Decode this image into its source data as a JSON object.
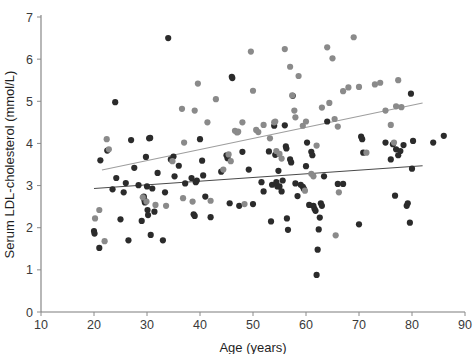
{
  "figure": {
    "background_color": "#ffffff",
    "axis_color": "#7d7d7d"
  },
  "chart_data": {
    "type": "scatter",
    "title": "",
    "subtitle": "",
    "xlabel": "Age (years)",
    "ylabel": "Serum LDL-cholesterol  (mmol/L)",
    "xlim": [
      10,
      90
    ],
    "ylim": [
      0,
      7
    ],
    "xticks": [
      10,
      20,
      30,
      40,
      50,
      60,
      70,
      80,
      90
    ],
    "yticks": [
      0,
      1,
      2,
      3,
      4,
      5,
      6,
      7
    ],
    "xtick_labels": [
      "10",
      "20",
      "30",
      "40",
      "50",
      "60",
      "70",
      "80",
      "90"
    ],
    "ytick_labels": [
      "0",
      "1",
      "2",
      "3",
      "4",
      "5",
      "6",
      "7"
    ],
    "grid": false,
    "legend": "none",
    "marker_radius": 3.1,
    "series": [
      {
        "name": "dark-group",
        "color": "#2b2b2b",
        "points": [
          [
            20.0,
            1.92
          ],
          [
            20.1,
            1.86
          ],
          [
            21.0,
            1.52
          ],
          [
            21.2,
            3.6
          ],
          [
            22.5,
            3.83
          ],
          [
            23.5,
            2.91
          ],
          [
            24.0,
            4.98
          ],
          [
            24.2,
            3.18
          ],
          [
            25.0,
            2.2
          ],
          [
            25.6,
            2.84
          ],
          [
            26.0,
            3.06
          ],
          [
            26.5,
            1.7
          ],
          [
            27.0,
            4.08
          ],
          [
            27.6,
            3.42
          ],
          [
            28.4,
            3.01
          ],
          [
            29.0,
            2.16
          ],
          [
            29.4,
            2.74
          ],
          [
            29.5,
            2.66
          ],
          [
            29.6,
            2.6
          ],
          [
            29.8,
            3.68
          ],
          [
            30.0,
            2.98
          ],
          [
            30.1,
            2.42
          ],
          [
            30.2,
            2.3
          ],
          [
            30.4,
            4.12
          ],
          [
            30.6,
            4.13
          ],
          [
            30.7,
            1.83
          ],
          [
            31.0,
            2.93
          ],
          [
            31.4,
            2.38
          ],
          [
            32.0,
            3.3
          ],
          [
            33.0,
            1.7
          ],
          [
            33.4,
            2.84
          ],
          [
            34.0,
            6.5
          ],
          [
            34.5,
            3.62
          ],
          [
            35.0,
            3.69
          ],
          [
            35.2,
            3.22
          ],
          [
            36.0,
            3.47
          ],
          [
            37.2,
            3.05
          ],
          [
            38.4,
            3.18
          ],
          [
            38.8,
            2.32
          ],
          [
            39.0,
            2.28
          ],
          [
            39.2,
            3.08
          ],
          [
            39.4,
            3.12
          ],
          [
            40.0,
            4.1
          ],
          [
            40.4,
            3.59
          ],
          [
            40.6,
            3.24
          ],
          [
            41.0,
            2.74
          ],
          [
            42.0,
            2.25
          ],
          [
            44.0,
            3.33
          ],
          [
            45.0,
            3.72
          ],
          [
            45.2,
            3.65
          ],
          [
            45.6,
            2.58
          ],
          [
            46.0,
            5.58
          ],
          [
            46.1,
            5.55
          ],
          [
            47.4,
            2.52
          ],
          [
            48.0,
            3.8
          ],
          [
            49.2,
            3.38
          ],
          [
            50.0,
            2.56
          ],
          [
            51.6,
            3.08
          ],
          [
            52.0,
            2.86
          ],
          [
            53.0,
            3.81
          ],
          [
            53.4,
            2.15
          ],
          [
            53.6,
            3.02
          ],
          [
            54.0,
            4.42
          ],
          [
            54.2,
            3.73
          ],
          [
            54.4,
            3.08
          ],
          [
            54.6,
            2.98
          ],
          [
            54.8,
            3.35
          ],
          [
            55.0,
            2.98
          ],
          [
            55.4,
            2.86
          ],
          [
            55.6,
            3.12
          ],
          [
            56.0,
            4.43
          ],
          [
            56.2,
            3.93
          ],
          [
            56.3,
            3.88
          ],
          [
            56.4,
            2.22
          ],
          [
            56.6,
            1.95
          ],
          [
            57.0,
            3.62
          ],
          [
            57.2,
            3.55
          ],
          [
            57.5,
            5.13
          ],
          [
            58.0,
            3.05
          ],
          [
            58.4,
            2.75
          ],
          [
            59.0,
            3.02
          ],
          [
            59.4,
            2.97
          ],
          [
            59.6,
            2.92
          ],
          [
            60.0,
            3.46
          ],
          [
            60.2,
            4.02
          ],
          [
            60.6,
            2.54
          ],
          [
            61.0,
            3.8
          ],
          [
            61.2,
            3.72
          ],
          [
            61.4,
            2.52
          ],
          [
            61.6,
            2.45
          ],
          [
            61.8,
            2.4
          ],
          [
            62.0,
            0.88
          ],
          [
            62.2,
            1.48
          ],
          [
            62.4,
            1.96
          ],
          [
            62.6,
            2.24
          ],
          [
            62.8,
            2.58
          ],
          [
            63.0,
            2.52
          ],
          [
            63.4,
            3.22
          ],
          [
            64.0,
            4.52
          ],
          [
            66.0,
            3.04
          ],
          [
            67.0,
            3.04
          ],
          [
            70.0,
            2.08
          ],
          [
            70.4,
            4.16
          ],
          [
            70.6,
            4.1
          ],
          [
            70.8,
            3.78
          ],
          [
            75.0,
            4.02
          ],
          [
            76.0,
            3.62
          ],
          [
            76.4,
            3.98
          ],
          [
            76.8,
            2.76
          ],
          [
            77.0,
            3.86
          ],
          [
            77.4,
            3.72
          ],
          [
            77.8,
            3.82
          ],
          [
            78.4,
            3.96
          ],
          [
            79.0,
            2.52
          ],
          [
            79.2,
            2.58
          ],
          [
            79.6,
            2.12
          ],
          [
            79.8,
            5.18
          ],
          [
            80.0,
            3.4
          ],
          [
            80.2,
            4.06
          ],
          [
            84.0,
            4.02
          ],
          [
            86.0,
            4.18
          ]
        ]
      },
      {
        "name": "light-group",
        "color": "#8a8a8a",
        "points": [
          [
            20.2,
            2.22
          ],
          [
            21.0,
            2.42
          ],
          [
            22.0,
            1.68
          ],
          [
            22.4,
            4.1
          ],
          [
            22.8,
            3.86
          ],
          [
            29.2,
            2.72
          ],
          [
            29.9,
            2.62
          ],
          [
            31.6,
            2.54
          ],
          [
            33.6,
            2.52
          ],
          [
            34.8,
            3.58
          ],
          [
            36.6,
            4.82
          ],
          [
            36.8,
            2.7
          ],
          [
            37.0,
            4.02
          ],
          [
            38.6,
            2.62
          ],
          [
            39.0,
            4.78
          ],
          [
            39.6,
            5.42
          ],
          [
            41.4,
            4.5
          ],
          [
            42.0,
            2.64
          ],
          [
            43.0,
            5.05
          ],
          [
            44.4,
            3.38
          ],
          [
            45.4,
            3.74
          ],
          [
            45.8,
            3.58
          ],
          [
            46.6,
            4.3
          ],
          [
            47.0,
            4.26
          ],
          [
            47.2,
            4.28
          ],
          [
            48.0,
            4.5
          ],
          [
            48.4,
            2.56
          ],
          [
            49.6,
            6.18
          ],
          [
            50.0,
            5.25
          ],
          [
            50.6,
            4.32
          ],
          [
            51.0,
            4.27
          ],
          [
            52.0,
            4.44
          ],
          [
            53.2,
            4.12
          ],
          [
            54.0,
            4.5
          ],
          [
            54.2,
            4.52
          ],
          [
            54.4,
            3.82
          ],
          [
            55.0,
            3.75
          ],
          [
            55.4,
            3.64
          ],
          [
            56.0,
            6.24
          ],
          [
            57.0,
            5.82
          ],
          [
            57.4,
            5.14
          ],
          [
            57.8,
            4.78
          ],
          [
            58.0,
            4.62
          ],
          [
            58.6,
            5.6
          ],
          [
            59.4,
            4.42
          ],
          [
            59.8,
            2.88
          ],
          [
            60.0,
            4.52
          ],
          [
            61.0,
            3.28
          ],
          [
            61.4,
            3.22
          ],
          [
            62.0,
            3.95
          ],
          [
            63.0,
            4.85
          ],
          [
            64.0,
            6.28
          ],
          [
            64.4,
            4.96
          ],
          [
            65.0,
            6.02
          ],
          [
            65.4,
            4.58
          ],
          [
            65.6,
            1.82
          ],
          [
            66.0,
            4.4
          ],
          [
            66.2,
            2.84
          ],
          [
            67.0,
            5.24
          ],
          [
            68.0,
            5.33
          ],
          [
            69.0,
            6.52
          ],
          [
            70.0,
            5.34
          ],
          [
            71.4,
            3.78
          ],
          [
            73.0,
            5.4
          ],
          [
            74.0,
            5.44
          ],
          [
            75.0,
            4.78
          ],
          [
            76.0,
            4.44
          ],
          [
            76.6,
            4.02
          ],
          [
            77.0,
            4.88
          ],
          [
            77.4,
            5.5
          ],
          [
            78.0,
            4.86
          ]
        ]
      }
    ],
    "fit_lines": [
      {
        "name": "light-group-fit",
        "color": "#9e9e9e",
        "x_start": 21.5,
        "y_start": 3.37,
        "x_end": 82.0,
        "y_end": 4.96
      },
      {
        "name": "dark-group-fit",
        "color": "#4a4a4a",
        "x_start": 20.0,
        "y_start": 2.93,
        "x_end": 82.0,
        "y_end": 3.47
      }
    ]
  }
}
